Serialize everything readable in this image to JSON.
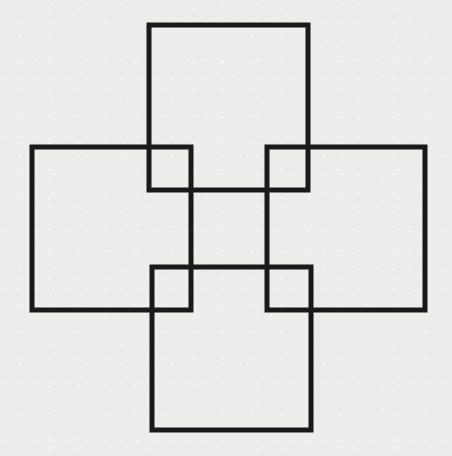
{
  "figure": {
    "title": "Four overlapping squares in pinwheel arrangement",
    "background_color": "#ededec",
    "stroke_color": "#1a1a1a",
    "stroke_width": 5,
    "canvas": {
      "width": 452,
      "height": 456
    },
    "shape_count": 4,
    "shapes": [
      {
        "name": "top-square",
        "label": "Top square",
        "x": 149,
        "y": 25,
        "width": 159,
        "height": 165
      },
      {
        "name": "left-square",
        "label": "Left square",
        "x": 32,
        "y": 147,
        "width": 159,
        "height": 163
      },
      {
        "name": "right-square",
        "label": "Right square",
        "x": 267,
        "y": 147,
        "width": 158,
        "height": 163
      },
      {
        "name": "bottom-square",
        "label": "Bottom square",
        "x": 152,
        "y": 267,
        "width": 159,
        "height": 163
      }
    ]
  }
}
